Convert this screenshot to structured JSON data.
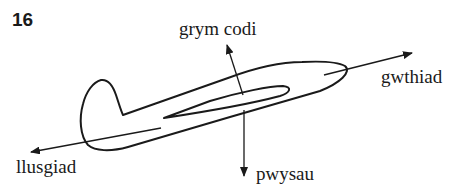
{
  "question_number": "16",
  "labels": {
    "lift": "grym codi",
    "thrust": "gwthiad",
    "drag": "llusgiad",
    "weight": "pwysau"
  },
  "colors": {
    "ink": "#1a1a1a",
    "background": "#ffffff"
  }
}
